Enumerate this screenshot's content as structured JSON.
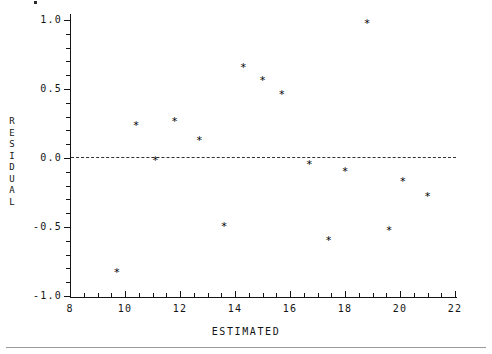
{
  "figure": {
    "background_color": "#ffffff",
    "ink_color": "#141414",
    "rule_color": "#9a9a9a"
  },
  "axis_titles": {
    "y": "RESIDUAL",
    "y_letters": [
      "R",
      "E",
      "S",
      "I",
      "D",
      "U",
      "A",
      "L"
    ],
    "x": "ESTIMATED"
  },
  "chart_data": {
    "type": "scatter",
    "title": "",
    "xlabel": "ESTIMATED",
    "ylabel": "RESIDUAL",
    "xlim": [
      8,
      22
    ],
    "ylim": [
      -1.0,
      1.0
    ],
    "grid": false,
    "legend": null,
    "marker": "*",
    "marker_color": "#000000",
    "reference_line": {
      "type": "horizontal-dashed",
      "y": 0.0,
      "color": "#333333"
    },
    "xticks": [
      8,
      10,
      12,
      14,
      16,
      18,
      20,
      22
    ],
    "xtick_labels": [
      "8",
      "10",
      "12",
      "14",
      "16",
      "18",
      "20",
      "22"
    ],
    "xtick_minor_step": 0.5,
    "yticks": [
      -1.0,
      -0.5,
      0.0,
      0.5,
      1.0
    ],
    "ytick_labels": [
      "-1.0",
      "-0.5",
      "0.0",
      "0.5",
      "1.0"
    ],
    "ytick_minor_step": 0.1,
    "points": [
      {
        "x": 9.7,
        "y": -0.83
      },
      {
        "x": 10.4,
        "y": 0.23
      },
      {
        "x": 11.1,
        "y": -0.02
      },
      {
        "x": 11.8,
        "y": 0.26
      },
      {
        "x": 12.7,
        "y": 0.12
      },
      {
        "x": 13.6,
        "y": -0.5
      },
      {
        "x": 14.3,
        "y": 0.65
      },
      {
        "x": 15.0,
        "y": 0.56
      },
      {
        "x": 15.7,
        "y": 0.46
      },
      {
        "x": 16.7,
        "y": -0.05
      },
      {
        "x": 17.4,
        "y": -0.6
      },
      {
        "x": 18.0,
        "y": -0.1
      },
      {
        "x": 18.8,
        "y": 0.97
      },
      {
        "x": 19.6,
        "y": -0.53
      },
      {
        "x": 20.1,
        "y": -0.17
      },
      {
        "x": 21.0,
        "y": -0.28
      }
    ]
  }
}
